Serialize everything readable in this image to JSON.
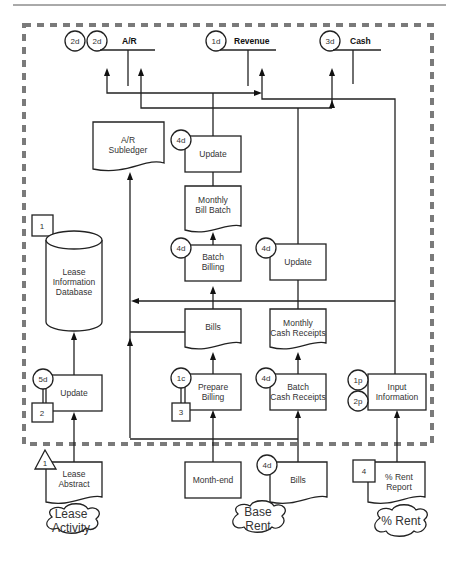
{
  "diagram": {
    "type": "lease revenue system flowchart",
    "ledgers": [
      {
        "id": "ar",
        "label": "A/R",
        "refs": [
          "2d",
          "2d"
        ]
      },
      {
        "id": "revenue",
        "label": "Revenue",
        "refs": [
          "1d"
        ]
      },
      {
        "id": "cash",
        "label": "Cash",
        "refs": [
          "3d"
        ]
      }
    ],
    "documents": {
      "ar_subledger": [
        "A/R",
        "Subledger"
      ],
      "monthly_bill_batch": [
        "Monthly",
        "Bill Batch"
      ],
      "bills_internal": [
        "Bills"
      ],
      "monthly_cash_receipts": [
        "Monthly",
        "Cash Receipts"
      ],
      "lease_abstract": [
        "Lease",
        "Abstract"
      ],
      "bills_external": [
        "Bills"
      ],
      "pct_rent_report": [
        "% Rent",
        "Report"
      ]
    },
    "processes": {
      "update_ar": {
        "label": [
          "Update"
        ],
        "ref": "4d"
      },
      "batch_billing": {
        "label": [
          "Batch",
          "Billing"
        ],
        "ref": "4d"
      },
      "update_cash": {
        "label": [
          "Update"
        ],
        "ref": "4d"
      },
      "prepare_billing": {
        "label": [
          "Prepare",
          "Billing"
        ],
        "ref": "1c",
        "box_ref": "3"
      },
      "batch_cash_receipts": {
        "label": [
          "Batch",
          "Cash Receipts"
        ],
        "ref": "4d"
      },
      "input_information": {
        "label": [
          "Input",
          "Information"
        ],
        "refs": [
          "1p",
          "2p"
        ]
      },
      "update_lease": {
        "label": [
          "Update"
        ],
        "ref": "5d",
        "box_ref": "2"
      },
      "month_end": {
        "label": [
          "Month-end"
        ]
      }
    },
    "database": {
      "label": [
        "Lease",
        "Information",
        "Database"
      ],
      "box_ref": "1"
    },
    "lease_abstract_triangle": "1",
    "bills_external_ref": "4d",
    "pct_rent_box_ref": "4",
    "sources": [
      {
        "id": "lease_activity",
        "label": [
          "Lease",
          "Activity"
        ]
      },
      {
        "id": "base_rent",
        "label": [
          "Base",
          "Rent"
        ]
      },
      {
        "id": "pct_rent",
        "label": [
          "% Rent"
        ]
      }
    ]
  }
}
